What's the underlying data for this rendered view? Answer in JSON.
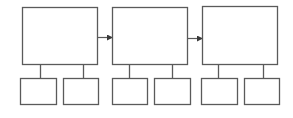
{
  "diagram": {
    "type": "hierarchy-flow",
    "stroke_color": "#5a5a5a",
    "background": "#ffffff",
    "main_boxes": [
      {
        "id": "main-1",
        "x": 22,
        "y": 7,
        "w": 75,
        "h": 57,
        "label": ""
      },
      {
        "id": "main-2",
        "x": 112,
        "y": 7,
        "w": 75,
        "h": 57,
        "label": ""
      },
      {
        "id": "main-3",
        "x": 202,
        "y": 6,
        "w": 75,
        "h": 58,
        "label": ""
      }
    ],
    "arrows": [
      {
        "from": "main-1",
        "to": "main-2",
        "x1": 97,
        "x2": 112,
        "y": 37
      },
      {
        "from": "main-2",
        "to": "main-3",
        "x1": 187,
        "x2": 202,
        "y": 38
      }
    ],
    "sub_boxes": [
      {
        "parent": "main-1",
        "x": 20,
        "y": 78,
        "w": 36,
        "h": 26,
        "connector_x": 40,
        "label": ""
      },
      {
        "parent": "main-1",
        "x": 63,
        "y": 78,
        "w": 35,
        "h": 26,
        "connector_x": 83,
        "label": ""
      },
      {
        "parent": "main-2",
        "x": 112,
        "y": 78,
        "w": 35,
        "h": 26,
        "connector_x": 129,
        "label": ""
      },
      {
        "parent": "main-2",
        "x": 154,
        "y": 78,
        "w": 36,
        "h": 26,
        "connector_x": 172,
        "label": ""
      },
      {
        "parent": "main-3",
        "x": 201,
        "y": 78,
        "w": 36,
        "h": 26,
        "connector_x": 218,
        "label": ""
      },
      {
        "parent": "main-3",
        "x": 244,
        "y": 78,
        "w": 35,
        "h": 26,
        "connector_x": 263,
        "label": ""
      }
    ]
  }
}
